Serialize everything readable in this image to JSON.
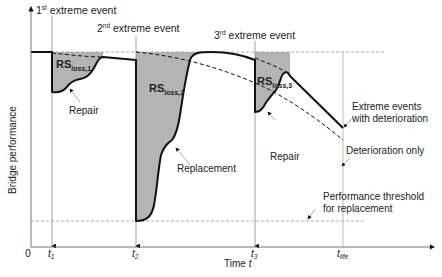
{
  "diagram": {
    "y_axis_label": "Bridge performance",
    "x_axis_label_prefix": "Time ",
    "x_axis_label_var": "t",
    "origin_label": "0",
    "time_ticks": [
      {
        "base": "t",
        "sub": "1",
        "x": 52
      },
      {
        "base": "t",
        "sub": "2",
        "x": 136
      },
      {
        "base": "t",
        "sub": "3",
        "x": 255
      },
      {
        "base": "t",
        "sub": "life",
        "x": 343
      }
    ],
    "events": [
      {
        "ordinal": "1",
        "suffix": "st",
        "text": " extreme event"
      },
      {
        "ordinal": "2",
        "suffix": "nd",
        "text": " extreme event"
      },
      {
        "ordinal": "3",
        "suffix": "rd",
        "text": " extreme event"
      }
    ],
    "loss_areas": [
      {
        "base": "RS",
        "sub": "loss,1"
      },
      {
        "base": "RS",
        "sub": "loss,2"
      },
      {
        "base": "RS",
        "sub": "loss,3"
      }
    ],
    "annotations": {
      "repair_1": "Repair",
      "replacement": "Replacement",
      "repair_3": "Repair",
      "extreme_with_det_line1": "Extreme events",
      "extreme_with_det_line2": "with deterioration",
      "deterioration_only": "Deterioration only",
      "threshold_line1": "Performance threshold",
      "threshold_line2": "for replacement"
    },
    "colors": {
      "loss_fill": "#b4b4b4",
      "curve": "#111111",
      "guide": "#999999"
    }
  }
}
